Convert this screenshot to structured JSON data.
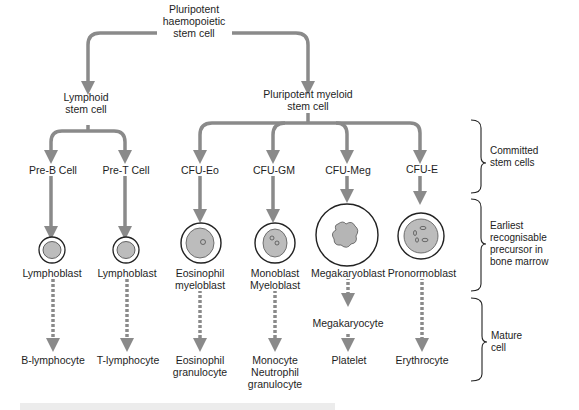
{
  "diagram": {
    "root": "Pluripotent\nhaemopoietic\nstem cell",
    "lymphoid": "Lymphoid\nstem cell",
    "myeloid": "Pluripotent myeloid\nstem cell",
    "committed": [
      "Pre-B Cell",
      "Pre-T Cell",
      "CFU-Eo",
      "CFU-GM",
      "CFU-Meg",
      "CFU-E"
    ],
    "precursors": [
      "Lymphoblast",
      "Lymphoblast",
      "Eosinophil\nmyeloblast",
      "Monoblast\nMyeloblast",
      "Megakaryoblast",
      "Pronormoblast"
    ],
    "intermediate": [
      "Megakaryocyte"
    ],
    "mature": [
      "B-lymphocyte",
      "T-lymphocyte",
      "Eosinophil\ngranulocyte",
      "Monocyte\nNeutrophil\ngranulocyte",
      "Platelet",
      "Erythrocyte"
    ],
    "stages": [
      {
        "label": "Committed\nstem cells"
      },
      {
        "label": "Earliest\nrecognisable\nprecursor in\nbone marrow"
      },
      {
        "label": "Mature\ncell"
      }
    ]
  },
  "colors": {
    "arrow": "#8a8a8a",
    "cell_fill": "#ffffff",
    "nucleus": "#b9b9b9",
    "text": "#1e1e1e"
  }
}
